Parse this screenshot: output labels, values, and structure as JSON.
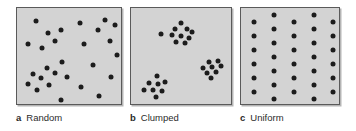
{
  "figure": {
    "type": "scientific-diagram",
    "background_color": "#ffffff",
    "panel_fill_color": "#d3d3d3",
    "panel_border_color": "#5a5a5a",
    "dot_color": "#1c1c1c",
    "dot_diameter_px": 5
  },
  "panels": [
    {
      "id": "panel-a",
      "letter": "a",
      "label": "Random",
      "x": 16,
      "y": 7,
      "width": 106,
      "height": 98,
      "dot_count": 27,
      "caption_x": 16,
      "caption_y": 112,
      "points": [
        [
          19,
          13
        ],
        [
          63,
          15
        ],
        [
          88,
          12
        ],
        [
          98,
          17
        ],
        [
          31,
          25
        ],
        [
          44,
          22
        ],
        [
          81,
          22
        ],
        [
          11,
          36
        ],
        [
          38,
          33
        ],
        [
          67,
          36
        ],
        [
          93,
          33
        ],
        [
          25,
          40
        ],
        [
          100,
          47
        ],
        [
          45,
          54
        ],
        [
          30,
          60
        ],
        [
          76,
          57
        ],
        [
          16,
          66
        ],
        [
          38,
          65
        ],
        [
          24,
          70
        ],
        [
          50,
          69
        ],
        [
          94,
          69
        ],
        [
          11,
          76
        ],
        [
          32,
          77
        ],
        [
          20,
          82
        ],
        [
          64,
          79
        ],
        [
          82,
          88
        ],
        [
          44,
          92
        ]
      ]
    },
    {
      "id": "panel-b",
      "letter": "b",
      "label": "Clumped",
      "x": 130,
      "y": 7,
      "width": 102,
      "height": 98,
      "dot_count": 26,
      "caption_x": 130,
      "caption_y": 112,
      "clusters": [
        {
          "name": "upper-cluster",
          "points": [
            [
              50,
              15
            ],
            [
              44,
              21
            ],
            [
              56,
              21
            ],
            [
              61,
              24
            ],
            [
              30,
              26
            ],
            [
              41,
              27
            ],
            [
              50,
              28
            ],
            [
              58,
              30
            ],
            [
              45,
              34
            ],
            [
              54,
              35
            ]
          ]
        },
        {
          "name": "right-cluster",
          "points": [
            [
              78,
              54
            ],
            [
              87,
              53
            ],
            [
              72,
              60
            ],
            [
              81,
              59
            ],
            [
              90,
              58
            ],
            [
              76,
              65
            ],
            [
              85,
              64
            ],
            [
              80,
              70
            ]
          ]
        },
        {
          "name": "lower-left-cluster",
          "points": [
            [
              26,
              68
            ],
            [
              18,
              75
            ],
            [
              27,
              76
            ],
            [
              34,
              74
            ],
            [
              13,
              82
            ],
            [
              22,
              82
            ],
            [
              31,
              83
            ],
            [
              25,
              89
            ]
          ]
        }
      ]
    },
    {
      "id": "panel-c",
      "letter": "c",
      "label": "Uniform",
      "x": 240,
      "y": 7,
      "width": 100,
      "height": 98,
      "dot_count": 33,
      "caption_x": 240,
      "caption_y": 112,
      "grid": {
        "description": "staggered lattice, 5 columns, alternating vertical offset",
        "columns_x": [
          13,
          33,
          53,
          73,
          92
        ],
        "rows_odd_y": [
          14,
          28,
          42,
          56,
          70,
          84
        ],
        "rows_even_y": [
          7,
          21,
          35,
          49,
          63,
          77,
          91
        ],
        "offset_columns": [
          1,
          3,
          5
        ]
      },
      "points": [
        [
          13,
          14
        ],
        [
          13,
          28
        ],
        [
          13,
          42
        ],
        [
          13,
          56
        ],
        [
          13,
          70
        ],
        [
          13,
          84
        ],
        [
          33,
          7
        ],
        [
          33,
          21
        ],
        [
          33,
          35
        ],
        [
          33,
          49
        ],
        [
          33,
          63
        ],
        [
          33,
          77
        ],
        [
          33,
          91
        ],
        [
          53,
          14
        ],
        [
          53,
          28
        ],
        [
          53,
          42
        ],
        [
          53,
          56
        ],
        [
          53,
          70
        ],
        [
          53,
          84
        ],
        [
          73,
          7
        ],
        [
          73,
          21
        ],
        [
          73,
          35
        ],
        [
          73,
          49
        ],
        [
          73,
          63
        ],
        [
          73,
          77
        ],
        [
          73,
          91
        ],
        [
          92,
          14
        ],
        [
          92,
          28
        ],
        [
          92,
          42
        ],
        [
          92,
          56
        ],
        [
          92,
          70
        ],
        [
          92,
          84
        ]
      ]
    }
  ]
}
